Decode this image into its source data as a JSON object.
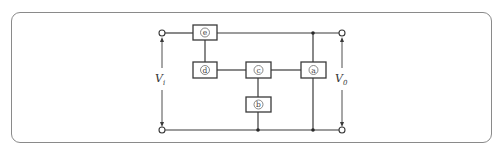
{
  "diagram": {
    "type": "block-circuit",
    "blocks": [
      {
        "id": "a",
        "label": "a"
      },
      {
        "id": "b",
        "label": "b"
      },
      {
        "id": "c",
        "label": "c"
      },
      {
        "id": "d",
        "label": "d"
      },
      {
        "id": "e",
        "label": "e"
      }
    ],
    "input_voltage": {
      "symbol": "V",
      "subscript": "i"
    },
    "output_voltage": {
      "symbol": "V",
      "subscript": "0"
    },
    "colors": {
      "line": "#3a3a3a",
      "frame": "#8a8a8a",
      "background": "#ffffff"
    }
  }
}
